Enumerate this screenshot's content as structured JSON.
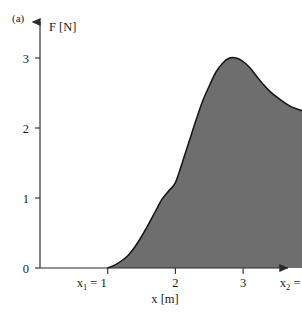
{
  "figure": {
    "panel_label": "(a)",
    "background_color": "#ffffff"
  },
  "chart_data": {
    "type": "area",
    "title": "",
    "subtitle": "",
    "xlabel": "x [m]",
    "ylabel": "F [N]",
    "xlim": [
      0.4,
      4.45
    ],
    "ylim": [
      0,
      3.35
    ],
    "grid": false,
    "legend": null,
    "fill_color": "#6e6e6e",
    "line_color": "#141414",
    "axis_color": "#2b2b2b",
    "xticks": [
      1,
      2,
      3,
      4
    ],
    "xticklabels": [
      "x₁ = 1",
      "2",
      "3",
      "x₂ = 4"
    ],
    "yticks": [
      0,
      1,
      2,
      3
    ],
    "yticklabels": [
      "0",
      "1",
      "2",
      "3"
    ],
    "annotations": [
      {
        "name": "lower-limit",
        "text": "x₁ = 1",
        "base": "x",
        "sub": "1",
        "value": 1
      },
      {
        "name": "upper-limit",
        "text": "x₂ = 4",
        "base": "x",
        "sub": "2",
        "value": 4
      }
    ],
    "shaded_region": {
      "from_x": 1,
      "to_x": 4,
      "label": "area under F(x)"
    },
    "x": [
      1.0,
      1.1,
      1.2,
      1.3,
      1.4,
      1.5,
      1.6,
      1.7,
      1.8,
      1.9,
      2.0,
      2.1,
      2.2,
      2.3,
      2.4,
      2.5,
      2.6,
      2.7,
      2.8,
      2.9,
      3.0,
      3.1,
      3.2,
      3.3,
      3.4,
      3.5,
      3.6,
      3.7,
      3.8,
      3.9,
      4.0
    ],
    "values": [
      0.0,
      0.04,
      0.1,
      0.18,
      0.3,
      0.45,
      0.62,
      0.8,
      0.98,
      1.1,
      1.22,
      1.5,
      1.8,
      2.1,
      2.38,
      2.6,
      2.8,
      2.93,
      3.0,
      3.0,
      2.95,
      2.86,
      2.74,
      2.62,
      2.52,
      2.44,
      2.37,
      2.31,
      2.27,
      2.24,
      2.21
    ],
    "series": [
      {
        "name": "F(x)",
        "values": [
          0.0,
          0.04,
          0.1,
          0.18,
          0.3,
          0.45,
          0.62,
          0.8,
          0.98,
          1.1,
          1.22,
          1.5,
          1.8,
          2.1,
          2.38,
          2.6,
          2.8,
          2.93,
          3.0,
          3.0,
          2.95,
          2.86,
          2.74,
          2.62,
          2.52,
          2.44,
          2.37,
          2.31,
          2.27,
          2.24,
          2.21
        ]
      }
    ],
    "peak": {
      "x": 2.85,
      "y": 3.0
    },
    "endpoint": {
      "x": 4.0,
      "y": 2.21
    }
  },
  "geometry": {
    "axis_x_px": 40,
    "axis_baseline_px": 268,
    "x_origin_px": 40,
    "x_per_unit_px": 67.7,
    "y_per_unit_px": 70,
    "y_axis_top_px": 18,
    "x_axis_right_px": 292
  }
}
